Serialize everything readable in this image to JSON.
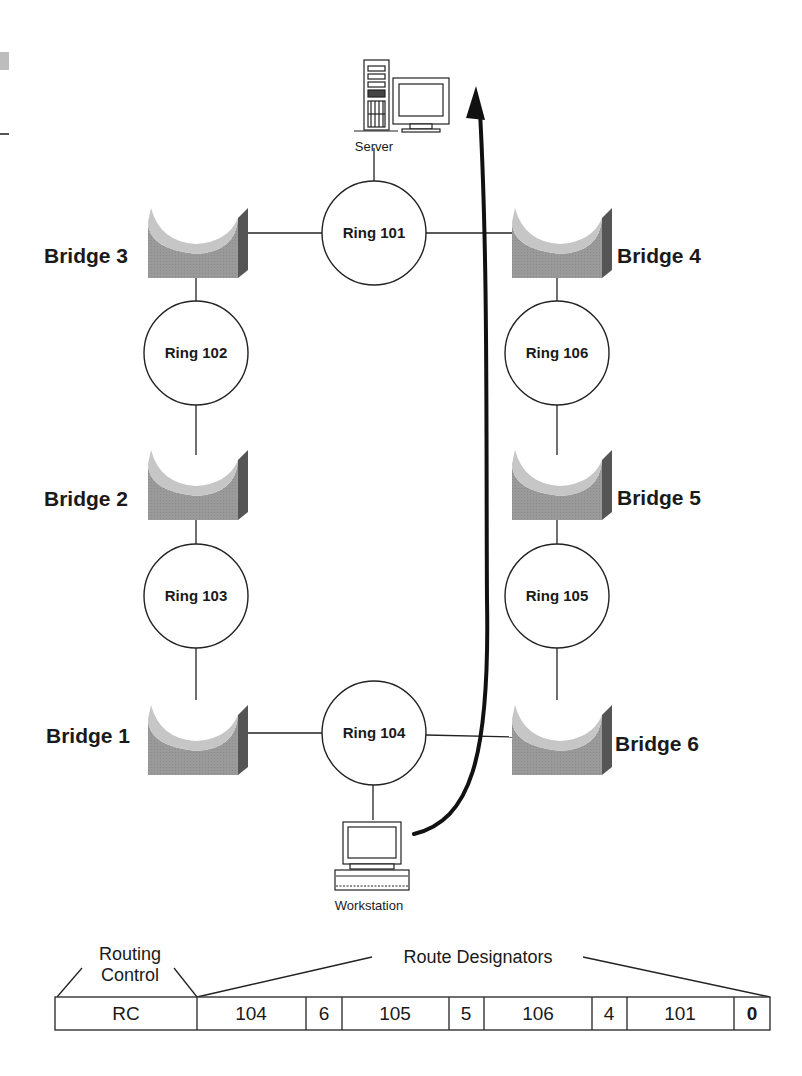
{
  "diagram": {
    "devices": {
      "server": {
        "label": "Server",
        "icon": "server-icon"
      },
      "workstation": {
        "label": "Workstation",
        "icon": "workstation-icon"
      }
    },
    "rings": {
      "r101": "Ring 101",
      "r102": "Ring 102",
      "r103": "Ring 103",
      "r104": "Ring 104",
      "r105": "Ring 105",
      "r106": "Ring 106"
    },
    "bridges": {
      "b1": "Bridge 1",
      "b2": "Bridge 2",
      "b3": "Bridge 3",
      "b4": "Bridge 4",
      "b5": "Bridge 5",
      "b6": "Bridge 6"
    },
    "route_arrow": {
      "from": "Workstation",
      "to": "Server",
      "color": "#111111"
    },
    "colors": {
      "bridge_front": "#9a9a9a",
      "bridge_top": "#c4c4c4",
      "bridge_side": "#5a5a5a",
      "line": "#222222"
    }
  },
  "frame": {
    "routing_control_label_line1": "Routing",
    "routing_control_label_line2": "Control",
    "route_designators_label": "Route Designators",
    "cells": [
      {
        "value": "RC",
        "bold": false
      },
      {
        "value": "104",
        "bold": false
      },
      {
        "value": "6",
        "bold": false
      },
      {
        "value": "105",
        "bold": false
      },
      {
        "value": "5",
        "bold": false
      },
      {
        "value": "106",
        "bold": false
      },
      {
        "value": "4",
        "bold": false
      },
      {
        "value": "101",
        "bold": false
      },
      {
        "value": "0",
        "bold": true
      }
    ]
  }
}
